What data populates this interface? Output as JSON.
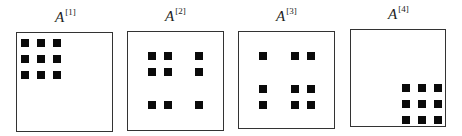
{
  "panels": [
    {
      "label": "A",
      "superscript": "[1]",
      "title_pos": [
        55,
        9
      ],
      "box": {
        "left": 16,
        "top": 32,
        "right": 113,
        "bottom": 132
      },
      "blocks": [
        [
          21,
          39
        ],
        [
          37,
          39
        ],
        [
          53,
          39
        ],
        [
          21,
          55
        ],
        [
          37,
          55
        ],
        [
          53,
          55
        ],
        [
          21,
          71
        ],
        [
          37,
          71
        ],
        [
          53,
          71
        ]
      ]
    },
    {
      "label": "A",
      "superscript": "[2]",
      "title_pos": [
        165,
        8
      ],
      "box": {
        "left": 127,
        "top": 31,
        "right": 224,
        "bottom": 131
      },
      "blocks": [
        [
          148,
          52
        ],
        [
          164,
          52
        ],
        [
          195,
          52
        ],
        [
          148,
          68
        ],
        [
          164,
          68
        ],
        [
          195,
          68
        ],
        [
          148,
          101
        ],
        [
          164,
          101
        ],
        [
          195,
          101
        ]
      ]
    },
    {
      "label": "A",
      "superscript": "[3]",
      "title_pos": [
        276,
        8
      ],
      "box": {
        "left": 238,
        "top": 31,
        "right": 335,
        "bottom": 129
      },
      "blocks": [
        [
          259,
          52
        ],
        [
          291,
          52
        ],
        [
          307,
          52
        ],
        [
          259,
          85
        ],
        [
          291,
          85
        ],
        [
          307,
          85
        ],
        [
          259,
          101
        ],
        [
          291,
          101
        ],
        [
          307,
          101
        ]
      ]
    },
    {
      "label": "A",
      "superscript": "[4]",
      "title_pos": [
        388,
        6
      ],
      "box": {
        "left": 350,
        "top": 29,
        "right": 446,
        "bottom": 127
      },
      "blocks": [
        [
          402,
          84
        ],
        [
          418,
          84
        ],
        [
          434,
          84
        ],
        [
          402,
          100
        ],
        [
          418,
          100
        ],
        [
          434,
          100
        ],
        [
          402,
          116
        ],
        [
          418,
          116
        ],
        [
          434,
          116
        ]
      ]
    }
  ],
  "colors": {
    "block": "#0a0a0a",
    "border": "#333333",
    "background": "#ffffff"
  }
}
